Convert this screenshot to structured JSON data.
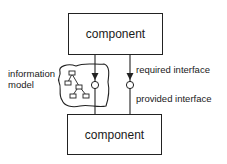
{
  "diagram": {
    "components": [
      {
        "id": "top",
        "label": "component"
      },
      {
        "id": "bottom",
        "label": "component"
      }
    ],
    "information_model": {
      "label_line1": "information",
      "label_line2": "model"
    },
    "interfaces": {
      "required_label": "required interface",
      "provided_label": "provided interface"
    },
    "colors": {
      "stroke": "#222222",
      "background": "#ffffff"
    }
  }
}
